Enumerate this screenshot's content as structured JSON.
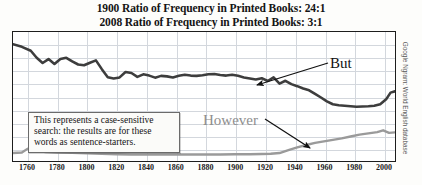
{
  "titles": {
    "line1": "1900 Ratio of Frequency in Printed Books: 24:1",
    "line2": "2008 Ratio of Frequency in Printed Books: 3:1"
  },
  "annotation_note": {
    "line1": "This represents a case-sensitive",
    "line2": "search: the results are for these",
    "line3": "words as sentence-starters."
  },
  "labels": {
    "but": "But",
    "however": "However"
  },
  "source_credit": "Google Ngram: World English database",
  "colors": {
    "but_line": "#3d3d3d",
    "however_line": "#9a9a9a",
    "grid": "#d3d7dd",
    "frame": "#1d1d1d",
    "text": "#141414",
    "however_label": "#8e8e8e"
  },
  "chart_data": {
    "type": "line",
    "xlabel": "",
    "ylabel": "",
    "xlim": [
      1750,
      2008
    ],
    "ylim": [
      0,
      1.0
    ],
    "grid": true,
    "legend_position": "inline-annotations",
    "xticks": [
      1760,
      1780,
      1800,
      1820,
      1840,
      1860,
      1880,
      1900,
      1920,
      1940,
      1960,
      1980,
      2000
    ],
    "annotations": [
      "This represents a case-sensitive search: the results are for these words as sentence-starters.",
      "Google Ngram: World English database"
    ],
    "series": [
      {
        "name": "But",
        "color": "#3d3d3d",
        "x": [
          1750,
          1756,
          1762,
          1766,
          1770,
          1774,
          1778,
          1782,
          1786,
          1790,
          1794,
          1798,
          1802,
          1806,
          1810,
          1814,
          1818,
          1822,
          1826,
          1830,
          1834,
          1838,
          1842,
          1846,
          1850,
          1854,
          1858,
          1862,
          1866,
          1870,
          1874,
          1878,
          1882,
          1886,
          1890,
          1894,
          1898,
          1902,
          1906,
          1910,
          1914,
          1918,
          1922,
          1926,
          1930,
          1934,
          1938,
          1942,
          1946,
          1950,
          1954,
          1958,
          1962,
          1966,
          1970,
          1974,
          1978,
          1982,
          1986,
          1990,
          1994,
          1998,
          2002,
          2005,
          2008
        ],
        "values": [
          0.905,
          0.885,
          0.855,
          0.8,
          0.76,
          0.79,
          0.752,
          0.79,
          0.8,
          0.772,
          0.748,
          0.742,
          0.762,
          0.78,
          0.712,
          0.65,
          0.64,
          0.648,
          0.69,
          0.682,
          0.652,
          0.672,
          0.662,
          0.646,
          0.66,
          0.656,
          0.648,
          0.66,
          0.668,
          0.662,
          0.66,
          0.664,
          0.672,
          0.674,
          0.666,
          0.662,
          0.668,
          0.66,
          0.648,
          0.64,
          0.632,
          0.642,
          0.62,
          0.648,
          0.6,
          0.622,
          0.596,
          0.58,
          0.562,
          0.548,
          0.52,
          0.492,
          0.462,
          0.44,
          0.432,
          0.428,
          0.424,
          0.42,
          0.422,
          0.424,
          0.428,
          0.44,
          0.478,
          0.53,
          0.54
        ]
      },
      {
        "name": "However",
        "color": "#9a9a9a",
        "x": [
          1750,
          1756,
          1760,
          1764,
          1768,
          1772,
          1780,
          1790,
          1800,
          1810,
          1820,
          1830,
          1840,
          1850,
          1860,
          1870,
          1880,
          1890,
          1900,
          1910,
          1918,
          1924,
          1930,
          1936,
          1942,
          1948,
          1954,
          1960,
          1966,
          1972,
          1978,
          1984,
          1990,
          1996,
          2000,
          2004,
          2008
        ],
        "values": [
          0.062,
          0.066,
          0.096,
          0.092,
          0.076,
          0.07,
          0.066,
          0.064,
          0.06,
          0.056,
          0.052,
          0.05,
          0.05,
          0.05,
          0.05,
          0.05,
          0.05,
          0.05,
          0.052,
          0.052,
          0.054,
          0.056,
          0.062,
          0.084,
          0.106,
          0.124,
          0.14,
          0.152,
          0.164,
          0.176,
          0.19,
          0.204,
          0.214,
          0.224,
          0.238,
          0.218,
          0.222
        ]
      }
    ]
  }
}
